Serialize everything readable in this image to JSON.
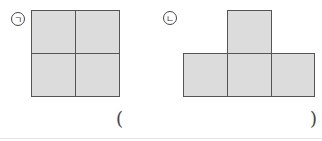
{
  "figures": [
    {
      "label": "ㄱ",
      "description": "2x2 square of four unit squares"
    },
    {
      "label": "ㄴ",
      "description": "T-shape: three squares in a row with one on top center"
    }
  ],
  "answer": {
    "open": "(",
    "close": ")",
    "value": ""
  }
}
